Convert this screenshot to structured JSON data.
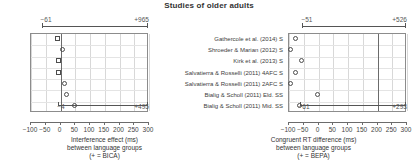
{
  "title": "Studies of older adults",
  "studies": [
    "Gathercole et al. (2014) S",
    "Shroeder & Marian (2012) S",
    "Kirk et al. (2013) S",
    "Salvatierra & Rosselli (2011) 4AFC S",
    "Salvatierra & Rosselli (2011) 2AFC S",
    "Bialig & Scholl (2011) Eld. SS",
    "Bialig & Scholl (2011) Mid. SS"
  ],
  "chart_data": [
    {
      "type": "scatter",
      "panel": "left",
      "title": "",
      "xlabel": "Interference effect (ms)",
      "xlabel_line2": "between language groups",
      "xlabel_line3": "(+ = BICA)",
      "ylabel": "",
      "xlim": [
        -100,
        300
      ],
      "xticks": [
        -100,
        -50,
        0,
        50,
        100,
        150,
        200,
        250,
        300
      ],
      "xticklabels": [
        "−100",
        "−50",
        "0",
        "50",
        "100",
        "150",
        "200",
        "250",
        "300"
      ],
      "grid": true,
      "zero_reference": 0,
      "categories": [
        "Gathercole et al. (2014) S",
        "Shroeder & Marian (2012) S",
        "Kirk et al. (2013) S",
        "Salvatierra & Rosselli (2011) 4AFC S",
        "Salvatierra & Rosselli (2011) 2AFC S",
        "Bialig & Scholl (2011) Eld. SS",
        "Bialig & Scholl (2011) Mid. SS"
      ],
      "values": [
        -4,
        12,
        -3,
        -3,
        17,
        24,
        54
      ],
      "markers": [
        "square",
        "circle",
        "square",
        "square",
        "circle",
        "circle",
        "circle"
      ],
      "top_bracket": {
        "left_label": "−61",
        "right_label": "+965",
        "from": -61,
        "to": 300
      },
      "bottom_bracket": {
        "left_label": "−4",
        "right_label": "+495",
        "from": -4,
        "to": 300
      }
    },
    {
      "type": "scatter",
      "panel": "right",
      "title": "",
      "xlabel": "Congruent RT difference (ms)",
      "xlabel_line2": "between language groups",
      "xlabel_line3": "(+ = BEPA)",
      "ylabel": "",
      "xlim": [
        -100,
        300
      ],
      "xticks": [
        -100,
        -50,
        0,
        50,
        100,
        150,
        200,
        250,
        300
      ],
      "xticklabels": [
        "−100",
        "−50",
        "0",
        "50",
        "100",
        "150",
        "200",
        "250",
        "300"
      ],
      "grid": true,
      "zero_reference": 200,
      "categories": [
        "Gathercole et al. (2014) S",
        "Shroeder & Marian (2012) S",
        "Kirk et al. (2013) S",
        "Salvatierra & Rosselli (2011) 4AFC S",
        "Salvatierra & Rosselli (2011) 2AFC S",
        "Bialig & Scholl (2011) Eld. SS",
        "Bialig & Scholl (2011) Mid. SS"
      ],
      "values": [
        -72,
        -90,
        -51,
        -72,
        -90,
        0,
        -61
      ],
      "markers": [
        "circle",
        "circle",
        "circle",
        "circle",
        "circle",
        "circle",
        "circle"
      ],
      "top_bracket": {
        "left_label": "−51",
        "right_label": "+526",
        "from": -51,
        "to": 300
      },
      "bottom_bracket": {
        "left_label": "−61",
        "right_label": "+293",
        "from": -61,
        "to": 300
      }
    }
  ]
}
